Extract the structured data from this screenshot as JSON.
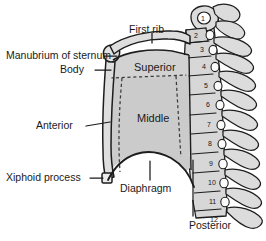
{
  "figure": {
    "background_color": "#ffffff",
    "ink_color": "#1a1a1a",
    "bone_fill": "#d9d9d9",
    "cavity_superior_fill": "#cfcfcf",
    "cavity_middle_fill": "#c6c6c6",
    "wall_fill": "#dcdcdc"
  },
  "labels": {
    "first_rib": "First rib",
    "manubrium": "Manubrium of sternum",
    "body": "Body",
    "anterior": "Anterior",
    "xiphoid_process": "Xiphoid process",
    "diaphragm": "Diaphragm",
    "superior": "Superior",
    "middle": "Middle",
    "posterior": "Posterior"
  },
  "vertebrae": {
    "label_group": "Thoracic vertebrae numbers",
    "numbers": [
      "1",
      "2",
      "3",
      "4",
      "5",
      "6",
      "7",
      "8",
      "9",
      "10",
      "11",
      "12"
    ]
  }
}
